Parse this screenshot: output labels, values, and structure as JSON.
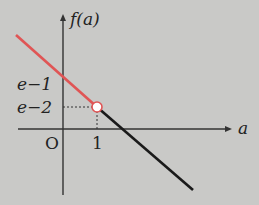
{
  "diagram": {
    "y_axis_label": "f(a)",
    "x_axis_label": "a",
    "origin_label": "O",
    "x_tick_label": "1",
    "y_tick_labels": [
      "e−1",
      "e−2"
    ],
    "colors": {
      "background": "#c9c9c7",
      "axis": "#333333",
      "left_segment": "#e05555",
      "right_segment": "#1a1a1a",
      "open_point_fill": "#ffffff"
    },
    "segments": [
      {
        "name": "left",
        "description": "line for a < 1, passes through (0, e-1) and ends at open point (1, e-2)",
        "color": "red"
      },
      {
        "name": "right",
        "description": "line for a > 1, starts at (1, e-2), crosses a-axis, decreasing",
        "color": "black"
      }
    ],
    "open_point": {
      "a": "1",
      "f": "e−2"
    }
  }
}
